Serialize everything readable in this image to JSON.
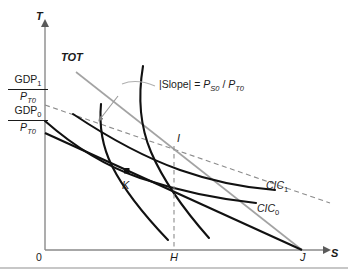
{
  "figure": {
    "type": "economics-indifference-curve-diagram",
    "axes": {
      "y_label": "T",
      "x_label": "S",
      "origin_label": "0"
    },
    "intercept_labels": [
      {
        "id": "gdp1",
        "numerator": "GDP",
        "numerator_sub": "1",
        "denominator": "P",
        "denominator_sub": "T0"
      },
      {
        "id": "gdp0",
        "numerator": "GDP",
        "numerator_sub": "0",
        "denominator": "P",
        "denominator_sub": "T0"
      }
    ],
    "points": [
      {
        "id": "point-i",
        "label": "I"
      },
      {
        "id": "point-k",
        "label": "K"
      },
      {
        "id": "point-h",
        "label": "H"
      },
      {
        "id": "point-j",
        "label": "J"
      }
    ],
    "curves": [
      {
        "id": "cic0",
        "label": "CIC",
        "label_sub": "0"
      },
      {
        "id": "cic1",
        "label": "CIC",
        "label_sub": "1"
      }
    ],
    "tot_label": "TOT",
    "slope_annotation": {
      "prefix": "|Slope| = ",
      "numerator": "P",
      "numerator_sub": "S0",
      "slash": " / ",
      "denominator": "P",
      "denominator_sub": "T0",
      "full_text": "|Slope| = P_S0 / P_T0"
    },
    "colors": {
      "curve_dark": "#111111",
      "budget_gray": "#9a9a9a",
      "dashed_gray": "#8c8c8c",
      "axis": "#8a8a8a",
      "text": "#1a1a1a",
      "divider": "#b5b5b5",
      "background": "#ffffff"
    }
  }
}
